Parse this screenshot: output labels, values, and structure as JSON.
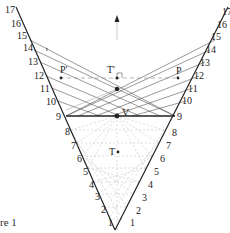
{
  "figure": {
    "caption": "re  1",
    "point_labels": {
      "T_prime": "T'",
      "P_prime": "P'",
      "P": "P",
      "V": "V",
      "T": "T",
      "small_t": "t"
    },
    "left_ticks": [
      "1",
      "2",
      "3",
      "4",
      "5",
      "6",
      "7",
      "8",
      "9",
      "10",
      "11",
      "12",
      "13",
      "14",
      "15",
      "16",
      "17"
    ],
    "right_ticks": [
      "1",
      "2",
      "3",
      "4",
      "5",
      "6",
      "7",
      "8",
      "9",
      "10",
      "11",
      "12",
      "13",
      "14",
      "15",
      "16",
      "17"
    ],
    "colors": {
      "ink": "#222222",
      "grey": "#9a9a9a",
      "dashed": "#888888"
    }
  }
}
